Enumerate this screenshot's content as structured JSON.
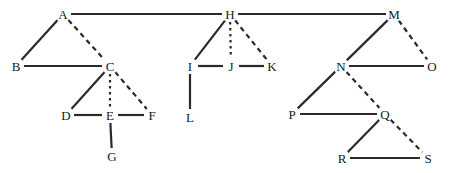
{
  "diagram": {
    "width": 449,
    "height": 173,
    "background_color": "#ffffff",
    "edge_color": "#2b2b2b",
    "label_color": "#1a1a1a",
    "solid_edge_width": 2.2,
    "dashed_edge_width": 2.2,
    "dash_pattern": "5,4",
    "dot_pattern": "2.5,3.5",
    "nodes": [
      {
        "id": "A",
        "label": "A",
        "x": 63,
        "y": 14
      },
      {
        "id": "B",
        "label": "B",
        "x": 16,
        "y": 66
      },
      {
        "id": "C",
        "label": "C",
        "x": 110,
        "y": 66
      },
      {
        "id": "D",
        "label": "D",
        "x": 66,
        "y": 115
      },
      {
        "id": "E",
        "label": "E",
        "x": 110,
        "y": 115
      },
      {
        "id": "F",
        "label": "F",
        "x": 152,
        "y": 115
      },
      {
        "id": "G",
        "label": "G",
        "x": 112,
        "y": 156
      },
      {
        "id": "H",
        "label": "H",
        "x": 230,
        "y": 14
      },
      {
        "id": "I",
        "label": "I",
        "x": 190,
        "y": 66
      },
      {
        "id": "J",
        "label": "J",
        "x": 231,
        "y": 66
      },
      {
        "id": "K",
        "label": "K",
        "x": 272,
        "y": 66
      },
      {
        "id": "L",
        "label": "L",
        "x": 190,
        "y": 117
      },
      {
        "id": "M",
        "label": "M",
        "x": 394,
        "y": 14
      },
      {
        "id": "N",
        "label": "N",
        "x": 341,
        "y": 66
      },
      {
        "id": "O",
        "label": "O",
        "x": 432,
        "y": 66
      },
      {
        "id": "P",
        "label": "P",
        "x": 292,
        "y": 114
      },
      {
        "id": "Q",
        "label": "Q",
        "x": 385,
        "y": 114
      },
      {
        "id": "R",
        "label": "R",
        "x": 342,
        "y": 158
      },
      {
        "id": "S",
        "label": "S",
        "x": 428,
        "y": 158
      }
    ],
    "edges": [
      {
        "from": "A",
        "to": "H",
        "style": "solid"
      },
      {
        "from": "A",
        "to": "B",
        "style": "solid"
      },
      {
        "from": "A",
        "to": "C",
        "style": "dashed"
      },
      {
        "from": "B",
        "to": "C",
        "style": "solid"
      },
      {
        "from": "C",
        "to": "D",
        "style": "solid"
      },
      {
        "from": "C",
        "to": "E",
        "style": "dotted"
      },
      {
        "from": "C",
        "to": "F",
        "style": "dashed"
      },
      {
        "from": "D",
        "to": "E",
        "style": "solid"
      },
      {
        "from": "E",
        "to": "F",
        "style": "solid"
      },
      {
        "from": "E",
        "to": "G",
        "style": "solid"
      },
      {
        "from": "H",
        "to": "M",
        "style": "solid"
      },
      {
        "from": "H",
        "to": "I",
        "style": "solid"
      },
      {
        "from": "H",
        "to": "J",
        "style": "dotted"
      },
      {
        "from": "H",
        "to": "K",
        "style": "dashed"
      },
      {
        "from": "I",
        "to": "J",
        "style": "solid"
      },
      {
        "from": "J",
        "to": "K",
        "style": "solid"
      },
      {
        "from": "I",
        "to": "L",
        "style": "solid"
      },
      {
        "from": "M",
        "to": "N",
        "style": "solid"
      },
      {
        "from": "M",
        "to": "O",
        "style": "dashed"
      },
      {
        "from": "N",
        "to": "O",
        "style": "solid"
      },
      {
        "from": "N",
        "to": "P",
        "style": "solid"
      },
      {
        "from": "N",
        "to": "Q",
        "style": "dashed"
      },
      {
        "from": "P",
        "to": "Q",
        "style": "solid"
      },
      {
        "from": "Q",
        "to": "R",
        "style": "solid"
      },
      {
        "from": "Q",
        "to": "S",
        "style": "dashed"
      },
      {
        "from": "R",
        "to": "S",
        "style": "solid"
      }
    ]
  }
}
